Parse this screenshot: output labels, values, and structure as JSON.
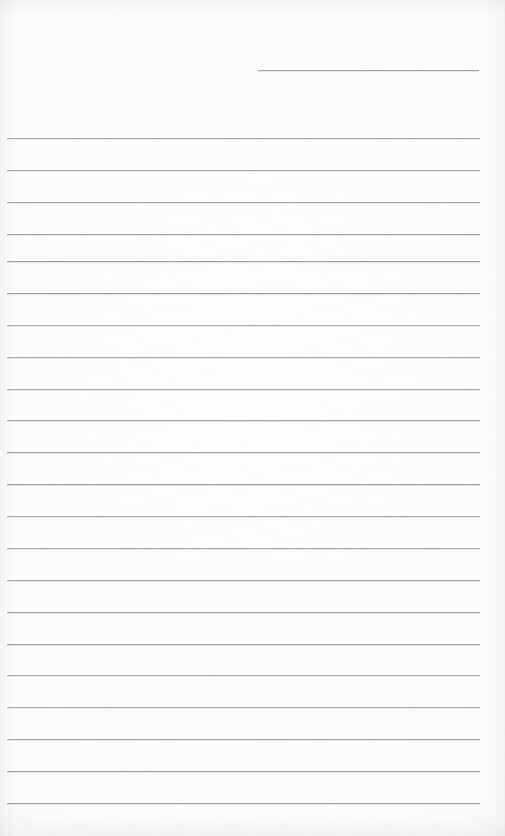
{
  "document": {
    "type": "blank-lined-notebook-page",
    "title": "",
    "text_content": "",
    "page_width": 505,
    "page_height": 836,
    "paper_color": "#fdfdfd",
    "rule_color": "#8e9099",
    "rule_thickness": 1,
    "rule_spacing": 32.3,
    "has_margin_line": false,
    "has_handwriting": false,
    "has_printed_text": false
  },
  "rules": {
    "partial_line": {
      "label": "top-partial-rule",
      "y": 70,
      "x_start": 258,
      "x_end": 479
    },
    "full_line_x_start": 7,
    "full_line_x_end": 480,
    "full_line_count": 21,
    "full_line_y_positions": [
      138,
      170,
      202,
      234,
      261,
      293,
      325,
      357,
      389,
      420,
      452,
      484,
      516,
      548,
      580,
      612,
      644,
      675,
      707,
      739,
      771,
      803
    ]
  }
}
